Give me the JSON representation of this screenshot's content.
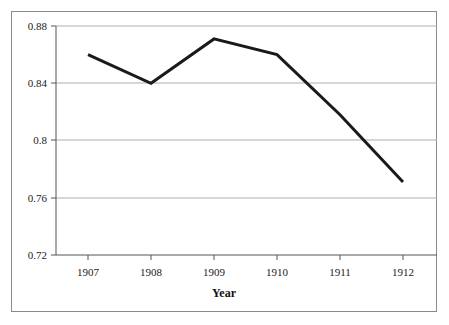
{
  "chart_data": {
    "type": "line",
    "title": "",
    "subtitle": "",
    "xlabel": "Year",
    "ylabel": "",
    "categories": [
      "1907",
      "1908",
      "1909",
      "1910",
      "1911",
      "1912"
    ],
    "x": [
      1907,
      1908,
      1909,
      1910,
      1911,
      1912
    ],
    "values": [
      0.86,
      0.84,
      0.871,
      0.86,
      0.818,
      0.771
    ],
    "series": [
      {
        "name": "",
        "values": [
          0.86,
          0.84,
          0.871,
          0.86,
          0.818,
          0.771
        ]
      }
    ],
    "xlim": [
      1906.5,
      1912.5
    ],
    "ylim": [
      0.72,
      0.88
    ],
    "ytick_labels": [
      "0.88",
      "0.84",
      "0.8",
      "0.76",
      "0.72"
    ],
    "ytick_values": [
      0.88,
      0.84,
      0.8,
      0.76,
      0.72
    ],
    "xtick_labels": [
      "1907",
      "1908",
      "1909",
      "1910",
      "1911",
      "1912"
    ],
    "grid": {
      "horizontal": true,
      "vertical": false,
      "color": "#aeaeae"
    },
    "legend": {
      "visible": false,
      "position": "none",
      "entries": []
    },
    "line_color": "#1a1a1a",
    "line_width": 3,
    "markers": false,
    "plot_background": "#ffffff",
    "frame_color": "#8a8a8a",
    "axis_color": "#555555"
  },
  "axes": {
    "y_labels": [
      {
        "text": "0.88",
        "value": 0.88
      },
      {
        "text": "0.84",
        "value": 0.84
      },
      {
        "text": "0.8",
        "value": 0.8
      },
      {
        "text": "0.76",
        "value": 0.76
      },
      {
        "text": "0.72",
        "value": 0.72
      }
    ],
    "x_labels": [
      {
        "text": "1907",
        "value": 1907
      },
      {
        "text": "1908",
        "value": 1908
      },
      {
        "text": "1909",
        "value": 1909
      },
      {
        "text": "1910",
        "value": 1910
      },
      {
        "text": "1911",
        "value": 1911
      },
      {
        "text": "1912",
        "value": 1912
      }
    ],
    "x_axis_title": "Year"
  }
}
